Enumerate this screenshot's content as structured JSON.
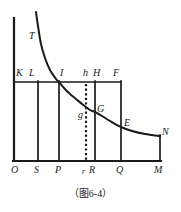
{
  "figure": {
    "caption": "（图6-4）",
    "background_color": "#ffffff",
    "ink_color": "#1a1a1a"
  },
  "chart_data": {
    "type": "line",
    "title": "",
    "xlabel": "",
    "ylabel": "",
    "grid": false,
    "legend": null,
    "xlim": [
      0,
      181
    ],
    "ylim": [
      212,
      0
    ],
    "series": [
      {
        "name": "curve-TN",
        "points": [
          [
            36,
            12
          ],
          [
            38,
            26
          ],
          [
            41,
            44
          ],
          [
            45,
            58
          ],
          [
            50,
            70
          ],
          [
            56,
            79
          ],
          [
            59,
            82
          ],
          [
            64,
            88
          ],
          [
            70,
            94
          ],
          [
            76,
            99
          ],
          [
            82,
            104
          ],
          [
            86,
            107
          ],
          [
            90,
            110
          ],
          [
            95,
            112
          ],
          [
            102,
            116
          ],
          [
            110,
            121
          ],
          [
            121,
            127
          ],
          [
            132,
            131
          ],
          [
            145,
            134
          ],
          [
            160,
            136
          ]
        ]
      }
    ],
    "axes": {
      "x_axis": {
        "y": 161,
        "x_start": 14,
        "x_end": 160
      },
      "y_axis": {
        "x": 14,
        "y_start": 18,
        "y_end": 161
      }
    },
    "vertical_lines": [
      {
        "name": "line-S",
        "x": 38,
        "y_top": 82,
        "y_bottom": 161,
        "style": "solid"
      },
      {
        "name": "line-P",
        "x": 59,
        "y_top": 82,
        "y_bottom": 161,
        "style": "solid"
      },
      {
        "name": "line-r",
        "x": 86,
        "y_top": 84,
        "y_bottom": 161,
        "style": "dotted"
      },
      {
        "name": "line-R",
        "x": 95,
        "y_top": 82,
        "y_bottom": 161,
        "style": "solid"
      },
      {
        "name": "line-Q",
        "x": 121,
        "y_top": 82,
        "y_bottom": 161,
        "style": "solid"
      },
      {
        "name": "line-M",
        "x": 160,
        "y_top": 136,
        "y_bottom": 161,
        "style": "solid"
      }
    ],
    "horizontal_lines": [
      {
        "name": "line-KF",
        "y": 82,
        "x_start": 14,
        "x_end": 121,
        "style": "solid"
      }
    ]
  },
  "labels": [
    {
      "id": "T",
      "text": "T",
      "x": 29,
      "y": 31
    },
    {
      "id": "K",
      "text": "K",
      "x": 16,
      "y": 68
    },
    {
      "id": "L",
      "text": "L",
      "x": 29,
      "y": 68
    },
    {
      "id": "I",
      "text": "I",
      "x": 60,
      "y": 68
    },
    {
      "id": "h",
      "text": "h",
      "x": 83,
      "y": 68
    },
    {
      "id": "H",
      "text": "H",
      "x": 93,
      "y": 68
    },
    {
      "id": "F",
      "text": "F",
      "x": 113,
      "y": 68
    },
    {
      "id": "g",
      "text": "g",
      "x": 78,
      "y": 110
    },
    {
      "id": "G",
      "text": "G",
      "x": 97,
      "y": 104
    },
    {
      "id": "E",
      "text": "E",
      "x": 124,
      "y": 118
    },
    {
      "id": "N",
      "text": "N",
      "x": 162,
      "y": 127
    },
    {
      "id": "O",
      "text": "O",
      "x": 11,
      "y": 165
    },
    {
      "id": "S",
      "text": "S",
      "x": 34,
      "y": 165
    },
    {
      "id": "P",
      "text": "P",
      "x": 55,
      "y": 165
    },
    {
      "id": "r",
      "text": "r",
      "x": 82,
      "y": 166
    },
    {
      "id": "R",
      "text": "R",
      "x": 90,
      "y": 165
    },
    {
      "id": "Q",
      "text": "Q",
      "x": 116,
      "y": 165
    },
    {
      "id": "M",
      "text": "M",
      "x": 155,
      "y": 165
    }
  ]
}
